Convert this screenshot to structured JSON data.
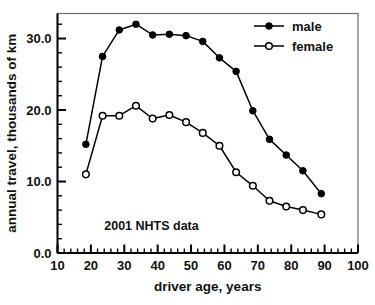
{
  "chart_data": {
    "type": "line",
    "title": "",
    "subtitle": "",
    "xlabel": "driver age, years",
    "ylabel": "annual travel, thousands of km",
    "xlim": [
      10,
      100
    ],
    "ylim": [
      0.0,
      33.5
    ],
    "x_major_ticks": [
      10,
      20,
      30,
      40,
      50,
      60,
      70,
      80,
      90,
      100
    ],
    "x_major_tick_labels": [
      "10",
      "20",
      "30",
      "40",
      "50",
      "60",
      "70",
      "80",
      "90",
      "100"
    ],
    "x_minor_tick_step": 2,
    "y_major_ticks": [
      0.0,
      10.0,
      20.0,
      30.0
    ],
    "y_major_tick_labels": [
      "0.0",
      "10.0",
      "20.0",
      "30.0"
    ],
    "y_minor_tick_step": 2,
    "grid": false,
    "legend_position": "top-right",
    "annotations": [
      {
        "text": "2001 NHTS data",
        "x": 24.0,
        "y": 3.2
      }
    ],
    "x": [
      18.5,
      23.5,
      28.5,
      33.5,
      38.5,
      43.5,
      48.5,
      53.5,
      58.5,
      63.5,
      68.5,
      73.5,
      78.5,
      83.5,
      89.0
    ],
    "series": [
      {
        "name": "male",
        "marker": "filled-circle",
        "color": "#000000",
        "values": [
          15.2,
          27.5,
          31.2,
          32.0,
          30.5,
          30.6,
          30.4,
          29.6,
          27.3,
          25.4,
          19.9,
          15.9,
          13.7,
          11.5,
          8.3
        ]
      },
      {
        "name": "female",
        "marker": "open-circle",
        "color": "#000000",
        "values": [
          11.0,
          19.2,
          19.2,
          20.6,
          18.8,
          19.3,
          18.3,
          16.8,
          15.0,
          11.3,
          9.4,
          7.3,
          6.5,
          6.0,
          5.4
        ]
      }
    ]
  },
  "legend": {
    "entries": [
      {
        "label": "male"
      },
      {
        "label": "female"
      }
    ]
  },
  "frame": {
    "border_color": "#6b6b6b",
    "axis_color": "#000000",
    "background": "#ffffff"
  }
}
